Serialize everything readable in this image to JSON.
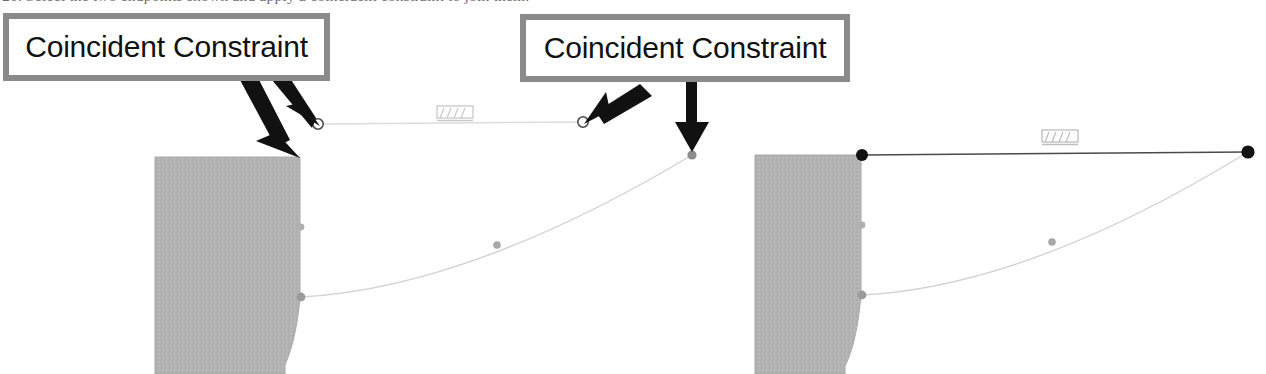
{
  "document": {
    "cropped_caption": "20. Select the two endpoints shown and apply a coincident constraint to join them."
  },
  "callouts": [
    {
      "id": "callout-1",
      "label": "Coincident Constraint",
      "border_color": "#8a8a8a",
      "text_color": "#111111",
      "x": 3,
      "y": 13,
      "w": 327,
      "h": 68,
      "arrows": [
        {
          "name": "arrow-to-open-endpoint",
          "from": [
            283,
            78
          ],
          "to": [
            318,
            124
          ]
        },
        {
          "name": "arrow-to-corner-vertex",
          "from": [
            256,
            80
          ],
          "to": [
            299,
            157
          ]
        }
      ]
    },
    {
      "id": "callout-2",
      "label": "Coincident Constraint",
      "border_color": "#8a8a8a",
      "text_color": "#111111",
      "x": 520,
      "y": 14,
      "w": 330,
      "h": 68,
      "arrows": [
        {
          "name": "arrow-to-open-endpoint",
          "from": [
            632,
            82
          ],
          "to": [
            586,
            124
          ]
        },
        {
          "name": "arrow-to-curve-endpoint",
          "from": [
            692,
            82
          ],
          "to": [
            692,
            152
          ]
        }
      ]
    }
  ],
  "sketches": [
    {
      "name": "sketch-before",
      "state": "unconstrained",
      "body": {
        "name": "shaded-body",
        "fill": "#b3b3b3",
        "left": 155,
        "right": 301,
        "top": 157,
        "bottom": 374,
        "curve_start_y": 297,
        "curve_end_x": 284
      },
      "line": {
        "name": "horizontal-construction-line",
        "from": [
          318,
          124
        ],
        "to": [
          583,
          122
        ],
        "color": "#d8d8d8",
        "endpoint_style": "open"
      },
      "curve": {
        "name": "tangent-arc",
        "from": [
          301,
          297
        ],
        "to": [
          692,
          155
        ],
        "control": [
          470,
          300
        ],
        "color": "#d0d0d0",
        "midpoint": [
          497,
          245
        ],
        "endpoint_style": "filled-gray"
      },
      "fixed_icon": {
        "name": "fixed-constraint-icon",
        "x": 437,
        "y": 106
      },
      "endpoints": [
        {
          "name": "endpoint-line-left",
          "x": 318,
          "y": 124,
          "style": "open"
        },
        {
          "name": "endpoint-line-right",
          "x": 583,
          "y": 122,
          "style": "open"
        },
        {
          "name": "endpoint-curve-top",
          "x": 692,
          "y": 155,
          "style": "gray"
        },
        {
          "name": "endpoint-curve-base",
          "x": 301,
          "y": 297,
          "style": "gray"
        },
        {
          "name": "midpoint-body-edge",
          "x": 301,
          "y": 227,
          "style": "gray"
        }
      ]
    },
    {
      "name": "sketch-after",
      "state": "coincident-applied",
      "body": {
        "name": "shaded-body",
        "fill": "#b3b3b3",
        "left": 755,
        "right": 862,
        "top": 155,
        "bottom": 374,
        "curve_start_y": 295,
        "curve_end_x": 845
      },
      "line": {
        "name": "horizontal-construction-line",
        "from": [
          862,
          155
        ],
        "to": [
          1248,
          152
        ],
        "color": "#555555",
        "endpoint_style": "filled-black"
      },
      "curve": {
        "name": "tangent-arc",
        "from": [
          862,
          295
        ],
        "to": [
          1248,
          152
        ],
        "control": [
          1030,
          300
        ],
        "color": "#d0d0d0",
        "midpoint": [
          1052,
          242
        ],
        "endpoint_style": "filled-gray"
      },
      "fixed_icon": {
        "name": "fixed-constraint-icon",
        "x": 1042,
        "y": 130
      },
      "endpoints": [
        {
          "name": "endpoint-line-left",
          "x": 862,
          "y": 155,
          "style": "black"
        },
        {
          "name": "endpoint-line-right",
          "x": 1248,
          "y": 152,
          "style": "black"
        },
        {
          "name": "endpoint-curve-base",
          "x": 862,
          "y": 295,
          "style": "gray"
        },
        {
          "name": "midpoint-body-edge",
          "x": 862,
          "y": 225,
          "style": "gray"
        }
      ]
    }
  ],
  "colors": {
    "page_background": "#ffffff",
    "body_fill": "#b3b3b3",
    "callout_border": "#8a8a8a",
    "arrow": "#111111",
    "faint_geometry": "#d8d8d8",
    "solid_geometry": "#555555"
  }
}
